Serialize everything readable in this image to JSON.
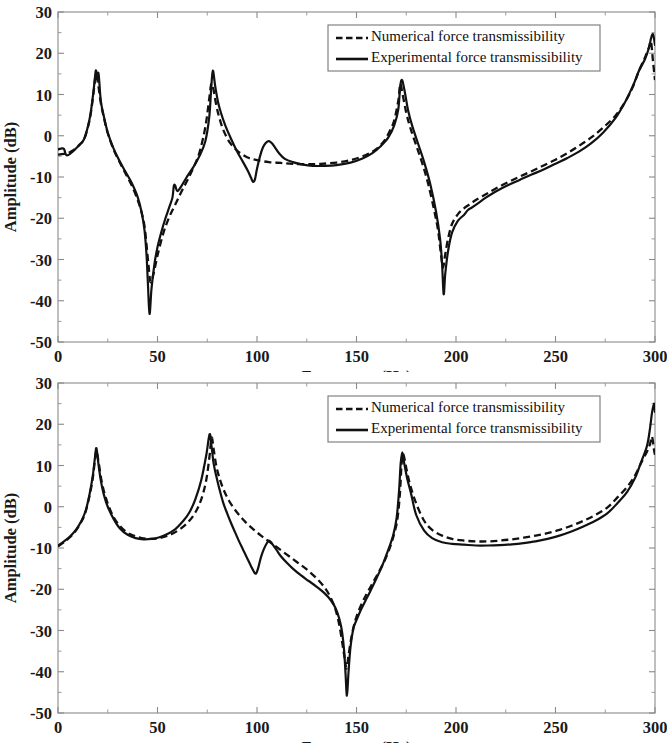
{
  "figure": {
    "title": "",
    "panel_count": 2
  },
  "chart_data": [
    {
      "type": "line",
      "id": "panel-top",
      "title": "",
      "xlabel": "Frequency (Hz)",
      "ylabel": "Amplitude (dB)",
      "xlim": [
        0,
        300
      ],
      "ylim": [
        -50,
        30
      ],
      "xticks": [
        0,
        50,
        100,
        150,
        200,
        250,
        300
      ],
      "xticklabels": [
        "0",
        "50",
        "100",
        "150",
        "200",
        "250",
        "300"
      ],
      "yticks": [
        -50,
        -40,
        -30,
        -20,
        -10,
        0,
        10,
        20,
        30
      ],
      "yticklabels": [
        "-50",
        "-40",
        "-30",
        "-20",
        "-10",
        "0",
        "10",
        "20",
        "30"
      ],
      "grid": false,
      "legend_position": "top-right",
      "legend": [
        {
          "label": "Numerical force transmissibility",
          "style": "dashed"
        },
        {
          "label": "Experimental force transmissibility",
          "style": "solid"
        }
      ],
      "annotations": {
        "resonances_hz": [
          19,
          77,
          172,
          298
        ],
        "antiresonances_hz": [
          45,
          193
        ]
      },
      "series": [
        {
          "name": "Numerical force transmissibility",
          "style": "dashed",
          "x": [
            0,
            3,
            5,
            7,
            9,
            11,
            13,
            15,
            16.5,
            18,
            19,
            20,
            21.5,
            23,
            25,
            28,
            31,
            34,
            37,
            40,
            42,
            43.5,
            44.5,
            45.5,
            46.5,
            48,
            50,
            53,
            56,
            59,
            62,
            65,
            68,
            71,
            74,
            76,
            77,
            78,
            79.5,
            81,
            83,
            86,
            90,
            95,
            100,
            106,
            112,
            118,
            125,
            132,
            140,
            148,
            155,
            160,
            164,
            167,
            169,
            171,
            172,
            173,
            175,
            177,
            180,
            183,
            186,
            189,
            191,
            192.5,
            193.5,
            194.5,
            196,
            198,
            201,
            204,
            207,
            210,
            215,
            220,
            226,
            232,
            238,
            244,
            250,
            256,
            262,
            268,
            274,
            280,
            285,
            289,
            292,
            295,
            297,
            298,
            299,
            300
          ],
          "y": [
            -4.6,
            -4.4,
            -4.2,
            -3.7,
            -3.0,
            -2.1,
            -1.0,
            2.0,
            5.5,
            11.0,
            14.8,
            13.0,
            8.0,
            4.5,
            0.6,
            -3.4,
            -6.4,
            -9.2,
            -12.0,
            -15.5,
            -18.6,
            -22.0,
            -26.5,
            -31.5,
            -35.5,
            -33.5,
            -29.0,
            -23.5,
            -19.6,
            -16.6,
            -13.6,
            -10.8,
            -7.8,
            -4.2,
            2.0,
            9.0,
            12.5,
            11.5,
            7.5,
            4.5,
            1.5,
            -1.4,
            -3.6,
            -5.2,
            -5.9,
            -6.4,
            -6.6,
            -6.8,
            -6.9,
            -6.8,
            -6.5,
            -5.8,
            -4.6,
            -3.2,
            -1.2,
            1.4,
            3.8,
            8.5,
            12.6,
            10.5,
            5.6,
            2.0,
            -2.3,
            -6.6,
            -11.6,
            -18.0,
            -23.0,
            -29.0,
            -32.0,
            -29.0,
            -25.0,
            -21.4,
            -19.0,
            -17.6,
            -16.6,
            -15.6,
            -14.2,
            -12.8,
            -11.3,
            -9.9,
            -8.6,
            -7.2,
            -5.8,
            -4.2,
            -2.4,
            -0.4,
            2.0,
            4.8,
            8.2,
            12.0,
            15.8,
            19.0,
            21.5,
            22.8,
            18.0,
            13.5,
            12.2
          ]
        },
        {
          "name": "Experimental force transmissibility",
          "style": "solid",
          "x": [
            0,
            1.5,
            3,
            4,
            5,
            6,
            7.5,
            9,
            11,
            13,
            15,
            16.5,
            18,
            19,
            19.6,
            20.4,
            21.5,
            23,
            25,
            28,
            31,
            34,
            37,
            40,
            42,
            43.5,
            44.5,
            45.2,
            46,
            47,
            48.5,
            50,
            52,
            54,
            56,
            57.5,
            58.2,
            58.8,
            60,
            62,
            65,
            68,
            71,
            74,
            76,
            77,
            77.8,
            79,
            80.5,
            82,
            84,
            87,
            90,
            93,
            95.5,
            97,
            98,
            99,
            100,
            101.5,
            103,
            104.5,
            106,
            107.5,
            109,
            111,
            114,
            118,
            123,
            128,
            134,
            140,
            147,
            153,
            158,
            162,
            166,
            169,
            171,
            172,
            173,
            174.5,
            176,
            178,
            181,
            184,
            187,
            190,
            192,
            193,
            193.8,
            194.6,
            196,
            198,
            201,
            204,
            206,
            208,
            211,
            215,
            220,
            226,
            232,
            238,
            244,
            250,
            256,
            262,
            268,
            274,
            280,
            285,
            289,
            292,
            295,
            297,
            298,
            299,
            300
          ],
          "y": [
            -3.3,
            -3.1,
            -3.2,
            -4.6,
            -4.7,
            -4.4,
            -3.8,
            -3.1,
            -2.1,
            -0.9,
            2.2,
            5.8,
            11.5,
            15.8,
            14.2,
            15.0,
            8.5,
            4.8,
            0.8,
            -3.2,
            -6.2,
            -8.8,
            -11.4,
            -14.8,
            -18.5,
            -23.0,
            -29.0,
            -36.0,
            -43.2,
            -37.0,
            -31.0,
            -27.0,
            -23.2,
            -20.0,
            -17.2,
            -15.0,
            -12.2,
            -12.0,
            -13.4,
            -12.2,
            -9.8,
            -7.6,
            -5.0,
            -1.4,
            4.5,
            11.5,
            15.8,
            12.0,
            8.0,
            5.4,
            2.6,
            -0.8,
            -3.8,
            -6.4,
            -8.6,
            -10.2,
            -11.2,
            -10.5,
            -8.0,
            -5.0,
            -2.8,
            -1.7,
            -1.3,
            -1.8,
            -2.8,
            -4.2,
            -5.6,
            -6.4,
            -7.0,
            -7.3,
            -7.3,
            -7.1,
            -6.5,
            -5.5,
            -4.2,
            -2.6,
            -0.4,
            2.6,
            6.4,
            12.2,
            13.4,
            10.0,
            6.0,
            2.4,
            -2.0,
            -6.4,
            -11.6,
            -18.5,
            -25.0,
            -31.0,
            -38.4,
            -33.5,
            -28.0,
            -23.5,
            -20.6,
            -19.2,
            -18.0,
            -17.4,
            -16.4,
            -15.0,
            -13.5,
            -12.0,
            -10.7,
            -9.4,
            -8.2,
            -6.8,
            -5.4,
            -3.8,
            -1.8,
            0.8,
            4.2,
            8.2,
            12.2,
            15.8,
            18.6,
            21.4,
            23.6,
            24.6,
            22.0,
            19.5
          ]
        }
      ]
    },
    {
      "type": "line",
      "id": "panel-bottom",
      "title": "",
      "xlabel": "Frequency (Hz)",
      "ylabel": "Amplitude (dB)",
      "xlim": [
        0,
        300
      ],
      "ylim": [
        -50,
        30
      ],
      "xticks": [
        0,
        50,
        100,
        150,
        200,
        250,
        300
      ],
      "xticklabels": [
        "0",
        "50",
        "100",
        "150",
        "200",
        "250",
        "300"
      ],
      "yticks": [
        -50,
        -40,
        -30,
        -20,
        -10,
        0,
        10,
        20,
        30
      ],
      "yticklabels": [
        "-50",
        "-40",
        "-30",
        "-20",
        "-10",
        "0",
        "10",
        "20",
        "30"
      ],
      "grid": false,
      "legend_position": "top-right",
      "legend": [
        {
          "label": "Numerical force transmissibility",
          "style": "dashed"
        },
        {
          "label": "Experimental force transmissibility",
          "style": "solid"
        }
      ],
      "annotations": {
        "resonances_hz": [
          19,
          77,
          172,
          298
        ],
        "antiresonances_hz": [
          145
        ]
      },
      "series": [
        {
          "name": "Numerical force transmissibility",
          "style": "dashed",
          "x": [
            0,
            3,
            6,
            9,
            12,
            14,
            16,
            17.5,
            18.6,
            19.4,
            20.5,
            22,
            24,
            27,
            30,
            34,
            38,
            42,
            46,
            50,
            54,
            58,
            62,
            66,
            69,
            72,
            74.5,
            76.2,
            77.2,
            78.2,
            79.5,
            81,
            83,
            86,
            90,
            94,
            98,
            102,
            106,
            110,
            115,
            120,
            125,
            130,
            134,
            137,
            139.5,
            141.5,
            143,
            144,
            145,
            146,
            147.5,
            149.5,
            152,
            155,
            158,
            161,
            164,
            167,
            169,
            170.5,
            171.8,
            172.6,
            173.5,
            175,
            177,
            180,
            184,
            188,
            193,
            198,
            204,
            210,
            216,
            222,
            228,
            234,
            240,
            246,
            252,
            258,
            264,
            270,
            276,
            281,
            286,
            290,
            293,
            296,
            297.5,
            298.5,
            299.5,
            300
          ],
          "y": [
            -9.6,
            -8.6,
            -7.4,
            -5.8,
            -3.4,
            -1.0,
            3.0,
            7.0,
            11.5,
            13.5,
            10.5,
            6.0,
            2.2,
            -1.6,
            -4.0,
            -6.0,
            -7.0,
            -7.6,
            -7.8,
            -7.7,
            -7.2,
            -6.4,
            -5.2,
            -3.4,
            -1.4,
            1.8,
            6.5,
            12.5,
            16.8,
            14.0,
            10.0,
            7.2,
            4.4,
            1.4,
            -1.4,
            -3.6,
            -5.4,
            -7.0,
            -8.4,
            -9.8,
            -11.6,
            -13.4,
            -15.2,
            -17.4,
            -19.6,
            -22.0,
            -25.0,
            -29.0,
            -33.5,
            -36.5,
            -39.2,
            -36.0,
            -31.5,
            -27.4,
            -24.2,
            -21.2,
            -18.6,
            -16.0,
            -13.2,
            -9.6,
            -6.4,
            -3.2,
            3.0,
            10.0,
            12.8,
            9.4,
            5.2,
            0.8,
            -3.4,
            -5.6,
            -7.0,
            -7.8,
            -8.2,
            -8.4,
            -8.4,
            -8.2,
            -7.9,
            -7.5,
            -7.0,
            -6.4,
            -5.6,
            -4.6,
            -3.4,
            -2.0,
            -0.2,
            2.2,
            4.8,
            7.6,
            10.6,
            13.4,
            15.2,
            17.0,
            13.8,
            12.6,
            12.2
          ]
        },
        {
          "name": "Experimental force transmissibility",
          "style": "solid",
          "x": [
            0,
            3,
            6,
            9,
            12,
            14,
            16,
            17.5,
            18.6,
            19.3,
            20.2,
            21.5,
            23,
            25,
            28,
            31,
            35,
            39,
            43,
            47,
            51,
            55,
            59,
            63,
            66,
            69,
            72,
            74.5,
            76.2,
            77.2,
            78.2,
            79.5,
            81,
            83,
            85,
            87,
            89,
            91,
            93,
            95,
            97,
            98.5,
            99.5,
            100.5,
            102,
            103.5,
            105,
            106,
            107,
            108.5,
            110,
            112,
            115,
            118,
            122,
            126,
            130,
            134,
            137,
            139.5,
            141.5,
            142.8,
            143.8,
            144.5,
            145.2,
            146,
            147,
            148.5,
            150,
            152,
            154.5,
            157,
            160,
            163,
            166,
            168.5,
            170.2,
            171.4,
            172.2,
            173,
            174,
            175.5,
            177.5,
            180,
            184,
            188,
            193,
            198,
            204,
            210,
            216,
            222,
            228,
            234,
            240,
            246,
            252,
            258,
            264,
            270,
            276,
            281,
            286,
            290,
            293,
            296,
            297.5,
            298.5,
            299.5,
            300
          ],
          "y": [
            -9.4,
            -8.4,
            -7.2,
            -5.6,
            -3.2,
            -0.8,
            3.4,
            7.6,
            12.0,
            14.2,
            10.8,
            6.4,
            3.0,
            0.0,
            -3.0,
            -5.2,
            -6.8,
            -7.6,
            -7.9,
            -7.8,
            -7.4,
            -6.6,
            -5.4,
            -3.4,
            -1.4,
            1.8,
            6.5,
            12.5,
            17.6,
            14.5,
            10.5,
            7.5,
            4.5,
            1.0,
            -1.6,
            -4.0,
            -6.2,
            -8.4,
            -10.4,
            -12.4,
            -14.4,
            -15.8,
            -16.2,
            -15.0,
            -12.2,
            -10.2,
            -8.8,
            -8.2,
            -8.6,
            -9.6,
            -10.6,
            -12.0,
            -13.6,
            -15.0,
            -16.6,
            -18.0,
            -19.4,
            -21.0,
            -22.6,
            -24.6,
            -27.4,
            -30.5,
            -35.0,
            -40.5,
            -45.8,
            -40.0,
            -34.0,
            -29.4,
            -27.5,
            -25.2,
            -22.8,
            -20.4,
            -17.4,
            -14.2,
            -10.4,
            -6.8,
            -2.6,
            4.0,
            10.5,
            13.2,
            10.5,
            6.8,
            3.0,
            -2.0,
            -5.8,
            -7.6,
            -8.6,
            -9.0,
            -9.2,
            -9.4,
            -9.4,
            -9.3,
            -9.1,
            -8.8,
            -8.4,
            -7.8,
            -7.0,
            -6.0,
            -4.8,
            -3.4,
            -1.6,
            0.8,
            3.6,
            7.0,
            10.8,
            14.8,
            19.0,
            22.8,
            25.0,
            23.0
          ]
        }
      ]
    }
  ]
}
